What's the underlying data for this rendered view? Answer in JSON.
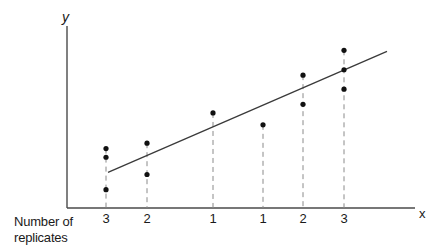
{
  "chart_data": {
    "type": "scatter",
    "title": "",
    "xlabel": "x",
    "ylabel": "y",
    "row_label": "Number of replicates",
    "row_label_lines": [
      "Number of",
      "replicates"
    ],
    "grid": false,
    "legend": null,
    "x_positions": [
      1,
      2,
      3,
      4,
      5,
      6
    ],
    "replicates": [
      "3",
      "2",
      "1",
      "1",
      "2",
      "3"
    ],
    "points": [
      {
        "x": 1,
        "y": [
          0.55,
          0.47,
          0.17
        ]
      },
      {
        "x": 2,
        "y": [
          0.6,
          0.31
        ]
      },
      {
        "x": 3,
        "y": [
          0.88
        ]
      },
      {
        "x": 4,
        "y": [
          0.77
        ]
      },
      {
        "x": 5,
        "y": [
          1.23,
          0.96
        ]
      },
      {
        "x": 6,
        "y": [
          1.46,
          1.28,
          1.1
        ]
      }
    ],
    "regression_line": {
      "x": [
        1,
        7.1
      ],
      "y": [
        0.33,
        1.45
      ]
    },
    "annotations": [
      "Dashed vertical lines drop from each x position to the x axis",
      "Solid fitted regression line through points"
    ]
  },
  "labels": {
    "y_axis": "y",
    "x_axis": "x",
    "row_label_line1": "Number of",
    "row_label_line2": "replicates",
    "ticks": [
      "3",
      "2",
      "1",
      "1",
      "2",
      "3"
    ]
  },
  "colors": {
    "axis": "#4a4a4a",
    "point": "#111111",
    "dashed": "#8a8a8a",
    "text": "#1a1a1a"
  }
}
